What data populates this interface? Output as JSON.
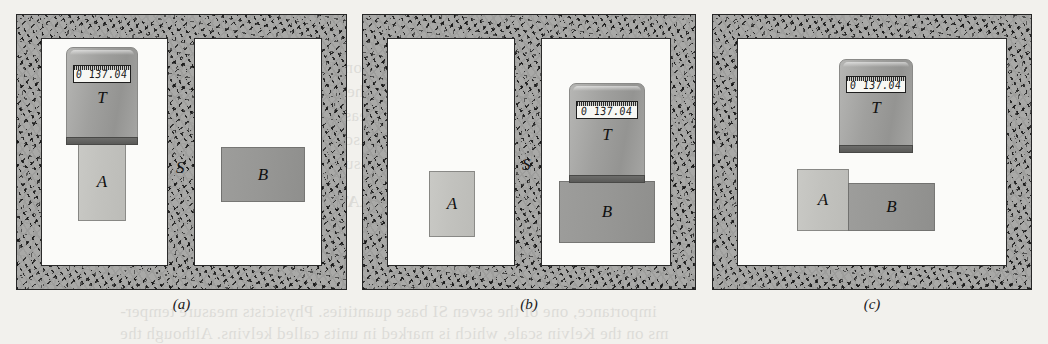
{
  "figure": {
    "thermometer_reading": "0 137.04",
    "labels": {
      "thermometer": "T",
      "body_a": "A",
      "body_b": "B",
      "divider": "S"
    },
    "panels": [
      {
        "id": "a",
        "caption": "(a)",
        "description": "Thermometer T in contact with body A; body B in a separate chamber, isolated by insulating divider S.",
        "divider_present": true,
        "divider_label": "S",
        "thermometer_on": "A",
        "reading": "0 137.04"
      },
      {
        "id": "b",
        "caption": "(b)",
        "description": "Thermometer T in contact with body B; body A in a separate chamber, isolated by insulating divider S.",
        "divider_present": true,
        "divider_label": "S",
        "thermometer_on": "B",
        "reading": "0 137.04"
      },
      {
        "id": "c",
        "caption": "(c)",
        "description": "Divider removed; bodies A and B placed in thermal contact with each other while thermometer T is nearby.",
        "divider_present": false,
        "divider_label": "",
        "thermometer_on": "none",
        "reading": "0 137.04"
      }
    ]
  },
  "bleed_text": {
    "lines": [
      "effect that temperature has on them.",
      "used here as a pathway to the actual",
      "a relevant and directly measurable",
      "The starting point in discussing",
      "perature and it is measured on",
      "PERATURE",
      "importance, one of the seven SI base quantities. Physicists measure temper-",
      "ms on the Kelvin scale, which is marked in units called kelvins. Although the"
    ]
  }
}
